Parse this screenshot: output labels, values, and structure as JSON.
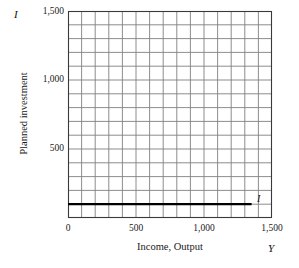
{
  "figure": {
    "background_color": "#ffffff",
    "grid_color": "#808080",
    "frame_color": "#3a3a3a",
    "series_color": "#000000"
  },
  "axes": {
    "y_symbol": "I",
    "x_symbol": "Y",
    "y_title": "Planned investment",
    "x_title": "Income, Output"
  },
  "chart_data": {
    "type": "line",
    "title": "",
    "subtitle": "",
    "xlabel": "Income, Output",
    "ylabel": "Planned investment",
    "x_axis_symbol": "Y",
    "y_axis_symbol": "I",
    "xlim": [
      0,
      1500
    ],
    "ylim": [
      0,
      1500
    ],
    "xticks": [
      0,
      500,
      1000,
      1500
    ],
    "xtick_labels": [
      "0",
      "500",
      "1,000",
      "1,500"
    ],
    "yticks": [
      500,
      1000,
      1500
    ],
    "ytick_labels": [
      "500",
      "1,000",
      "1,500"
    ],
    "grid": true,
    "grid_spacing": 100,
    "grid_columns": 15,
    "grid_rows": 15,
    "legend": "none",
    "series": [
      {
        "name": "I",
        "label": "I",
        "description": "Planned investment is autonomous: constant at 100 regardless of income",
        "x": [
          0,
          1350
        ],
        "values": [
          100,
          100
        ],
        "line_width": 2.2,
        "color": "#000000"
      }
    ],
    "annotations": [
      {
        "text": "I",
        "x": 1390,
        "y": 100,
        "style": "italic"
      }
    ]
  }
}
